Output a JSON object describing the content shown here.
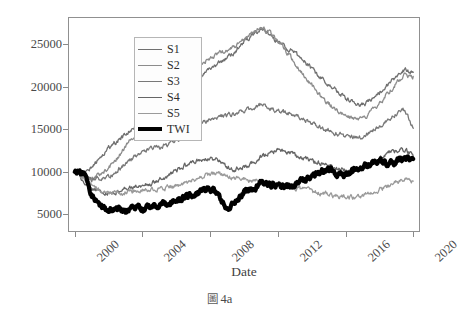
{
  "caption": {
    "glyph": "圖",
    "text": "4a"
  },
  "legend": {
    "position": "upper-left-inside",
    "entries": [
      {
        "label": "S1",
        "color": "#707070",
        "width": 1.3
      },
      {
        "label": "S2",
        "color": "#8c8c8c",
        "width": 1.3
      },
      {
        "label": "S3",
        "color": "#787878",
        "width": 1.3
      },
      {
        "label": "S4",
        "color": "#666666",
        "width": 1.3
      },
      {
        "label": "S5",
        "color": "#9a9a9a",
        "width": 1.3
      },
      {
        "label": "TWI",
        "color": "#000000",
        "width": 4.2
      }
    ]
  },
  "axes": {
    "xlabel": "Date",
    "ylabel": "",
    "xticks": [
      "2000",
      "2004",
      "2008",
      "2012",
      "2016",
      "2020"
    ],
    "yticks": [
      "5000",
      "10000",
      "15000",
      "20000",
      "25000"
    ],
    "grid": false
  },
  "chart_data": {
    "type": "line",
    "title": "",
    "subtitle": "",
    "xlabel": "Date",
    "ylabel": "",
    "xlim": [
      1999.6,
      2020.4
    ],
    "ylim": [
      2900,
      28200
    ],
    "xticks": [
      2000,
      2004,
      2008,
      2012,
      2016,
      2020
    ],
    "yticks": [
      5000,
      10000,
      15000,
      20000,
      25000
    ],
    "grid": false,
    "legend_position": "upper left",
    "annotations": [],
    "x": [
      2000.0,
      2000.5,
      2001.0,
      2001.5,
      2002.0,
      2002.5,
      2003.0,
      2003.5,
      2004.0,
      2004.5,
      2005.0,
      2005.5,
      2006.0,
      2006.5,
      2007.0,
      2007.5,
      2008.0,
      2008.5,
      2009.0,
      2009.5,
      2010.0,
      2010.5,
      2011.0,
      2011.5,
      2012.0,
      2012.5,
      2013.0,
      2013.5,
      2014.0,
      2014.5,
      2015.0,
      2015.5,
      2016.0,
      2016.5,
      2017.0,
      2017.5,
      2018.0,
      2018.5,
      2019.0,
      2019.5,
      2020.0
    ],
    "series": [
      {
        "name": "S1",
        "color": "#707070",
        "linewidth": 1.3,
        "values": [
          10000,
          9700,
          10400,
          11600,
          12800,
          13600,
          14300,
          15200,
          16100,
          16900,
          17200,
          17700,
          18600,
          19600,
          20700,
          21400,
          22100,
          22700,
          23300,
          24200,
          25300,
          26100,
          26800,
          26200,
          25300,
          24600,
          23900,
          23100,
          22100,
          21200,
          20300,
          19400,
          18600,
          18100,
          17900,
          18400,
          19300,
          20300,
          21200,
          22000,
          21700
        ]
      },
      {
        "name": "S2",
        "color": "#8c8c8c",
        "linewidth": 1.3,
        "values": [
          10000,
          9300,
          9100,
          9600,
          10500,
          11600,
          12900,
          14300,
          15700,
          16800,
          17500,
          18200,
          19100,
          20200,
          21500,
          22600,
          23400,
          23900,
          24200,
          24800,
          25600,
          26400,
          26900,
          26300,
          25400,
          24200,
          22800,
          21500,
          20200,
          19000,
          18000,
          17200,
          16600,
          16300,
          16400,
          17000,
          18000,
          19200,
          20400,
          21400,
          21200
        ]
      },
      {
        "name": "S3",
        "color": "#787878",
        "linewidth": 1.3,
        "values": [
          10000,
          9500,
          9000,
          9100,
          9500,
          10100,
          10900,
          11700,
          12300,
          12700,
          12900,
          13200,
          13700,
          14300,
          15100,
          15700,
          16200,
          16500,
          16600,
          16900,
          17200,
          17500,
          17900,
          17600,
          17200,
          16900,
          16600,
          16200,
          15700,
          15300,
          14900,
          14500,
          14200,
          14000,
          14100,
          14600,
          15400,
          16200,
          16900,
          17300,
          15100
        ]
      },
      {
        "name": "S4",
        "color": "#666666",
        "linewidth": 1.3,
        "values": [
          10000,
          8800,
          8000,
          7600,
          7500,
          7700,
          7900,
          8100,
          8300,
          8600,
          9000,
          9500,
          10100,
          10700,
          11200,
          11500,
          11600,
          11300,
          10600,
          10300,
          10500,
          11000,
          11700,
          12200,
          12500,
          12300,
          11900,
          11600,
          11300,
          11000,
          10700,
          10400,
          10200,
          10200,
          10400,
          10900,
          11500,
          12100,
          12500,
          12600,
          11800
        ]
      },
      {
        "name": "S5",
        "color": "#9a9a9a",
        "linewidth": 1.3,
        "values": [
          10000,
          9200,
          8400,
          7900,
          7700,
          7600,
          7600,
          7700,
          7800,
          7900,
          8000,
          8100,
          8300,
          8600,
          9000,
          9400,
          9700,
          9800,
          9500,
          9200,
          9100,
          9000,
          8900,
          8700,
          8500,
          8300,
          8100,
          7900,
          7700,
          7500,
          7300,
          7100,
          7000,
          7000,
          7200,
          7500,
          7900,
          8300,
          8700,
          9000,
          8900
        ]
      },
      {
        "name": "TWI",
        "color": "#000000",
        "linewidth": 4.2,
        "values": [
          10000,
          9900,
          7400,
          5700,
          5400,
          5600,
          5300,
          5800,
          5600,
          5900,
          6000,
          6300,
          6700,
          7000,
          7400,
          7700,
          8100,
          7100,
          5200,
          6400,
          7600,
          8100,
          8500,
          8600,
          8300,
          8200,
          8400,
          8900,
          9400,
          9900,
          10300,
          9800,
          9600,
          10100,
          10600,
          11000,
          11300,
          10900,
          11200,
          11600,
          11500
        ]
      }
    ]
  }
}
